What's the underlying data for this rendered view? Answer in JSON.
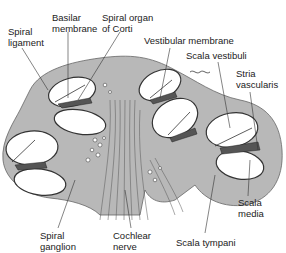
{
  "figure": {
    "colors": {
      "tissue": "#b8b8b8",
      "outline": "#333333",
      "background": "#ffffff",
      "membrane": "#555555"
    }
  },
  "labels": [
    {
      "id": "spiral-ligament",
      "text": "Spiral\nligament",
      "x": 8,
      "y": 26
    },
    {
      "id": "basilar-membrane",
      "text": "Basilar\nmembrane",
      "x": 52,
      "y": 12
    },
    {
      "id": "spiral-organ-of-corti",
      "text": "Spiral organ\nof Corti",
      "x": 102,
      "y": 12
    },
    {
      "id": "vestibular-membrane",
      "text": "Vestibular membrane",
      "x": 144,
      "y": 38
    },
    {
      "id": "scala-vestibuli",
      "text": "Scala vestibuli",
      "x": 190,
      "y": 52
    },
    {
      "id": "stria-vascularis",
      "text": "Stria\nvascularis",
      "x": 238,
      "y": 69
    },
    {
      "id": "scala-media",
      "text": "Scala\nmedia",
      "x": 238,
      "y": 197
    },
    {
      "id": "scala-tympani",
      "text": "Scala tympani",
      "x": 176,
      "y": 236
    },
    {
      "id": "cochlear-nerve",
      "text": "Cochlear\nnerve",
      "x": 113,
      "y": 230
    },
    {
      "id": "spiral-ganglion",
      "text": "Spiral\nganglion",
      "x": 40,
      "y": 230
    }
  ]
}
